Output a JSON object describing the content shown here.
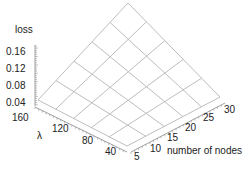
{
  "chart_data": {
    "type": "surface3d",
    "title": "",
    "zlabel": "loss",
    "ylabel": "λ",
    "xlabel": "number of nodes",
    "z_ticks": [
      "0.16",
      "0.12",
      "0.08",
      "0.04"
    ],
    "y_ticks": [
      "160",
      "120",
      "80",
      "40"
    ],
    "x_ticks": [
      "5",
      "10",
      "15",
      "20",
      "25",
      "30"
    ],
    "x": [
      5,
      10,
      15,
      20,
      25,
      30
    ],
    "y": [
      40,
      64,
      88,
      112,
      136,
      160
    ],
    "grid_size": [
      6,
      6
    ],
    "surface_corners": {
      "nodes5_lambda40": 0.03,
      "nodes30_lambda40": 0.1,
      "nodes5_lambda160": 0.1,
      "nodes30_lambda160": 0.19
    },
    "zlim": [
      0.03,
      0.19
    ],
    "wireframe_color": "#bdbdbd"
  },
  "labels": {
    "loss": "loss",
    "lambda": "λ",
    "nodes": "number of nodes"
  }
}
